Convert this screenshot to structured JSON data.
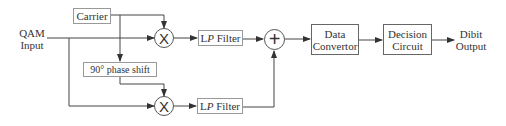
{
  "diagram": {
    "type": "block-diagram",
    "input": {
      "line1": "QAM",
      "line2": "Input"
    },
    "output": {
      "line1": "Dibit",
      "line2": "Output"
    },
    "blocks": {
      "carrier": {
        "label": "Carrier"
      },
      "phase_shift": {
        "label": "90° phase shift"
      },
      "multiplier_top": {
        "symbol": "X"
      },
      "multiplier_bottom": {
        "symbol": "X"
      },
      "lp_filter_top": {
        "prefix": "L",
        "italic": "P",
        "suffix": " Filter"
      },
      "lp_filter_bottom": {
        "prefix": "L",
        "italic": "P",
        "suffix": " Filter"
      },
      "adder": {
        "symbol": "+"
      },
      "data_convertor": {
        "line1": "Data",
        "line2": "Convertor"
      },
      "decision_circuit": {
        "line1": "Decision",
        "line2": "Circuit"
      }
    },
    "connections": [
      {
        "from": "QAM Input",
        "to": "multiplier_top"
      },
      {
        "from": "QAM Input",
        "to": "multiplier_bottom"
      },
      {
        "from": "carrier",
        "to": "multiplier_top"
      },
      {
        "from": "carrier",
        "to": "phase_shift"
      },
      {
        "from": "phase_shift",
        "to": "multiplier_bottom"
      },
      {
        "from": "multiplier_top",
        "to": "lp_filter_top"
      },
      {
        "from": "multiplier_bottom",
        "to": "lp_filter_bottom"
      },
      {
        "from": "lp_filter_top",
        "to": "adder"
      },
      {
        "from": "lp_filter_bottom",
        "to": "adder"
      },
      {
        "from": "adder",
        "to": "data_convertor"
      },
      {
        "from": "data_convertor",
        "to": "decision_circuit"
      },
      {
        "from": "decision_circuit",
        "to": "Dibit Output"
      }
    ]
  },
  "colors": {
    "line": "#444444",
    "box_border": "#666666",
    "text": "#333333"
  }
}
